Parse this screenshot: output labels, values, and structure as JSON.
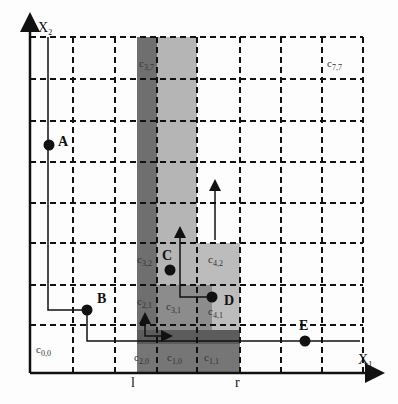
{
  "diagram": {
    "axes": {
      "x_label": "X",
      "x_sub": "1",
      "y_label": "X",
      "y_sub": "2"
    },
    "grid": {
      "cols": 8,
      "rows": 8
    },
    "range_markers": {
      "left": "l",
      "right": "r"
    },
    "points": [
      {
        "id": "A",
        "label": "A"
      },
      {
        "id": "B",
        "label": "B"
      },
      {
        "id": "C",
        "label": "C"
      },
      {
        "id": "D",
        "label": "D"
      },
      {
        "id": "E",
        "label": "E"
      }
    ],
    "cell_labels": {
      "c00": {
        "base": "c",
        "sub": "0,0"
      },
      "c77": {
        "base": "c",
        "sub": "7,7"
      },
      "c37": {
        "base": "c",
        "sub": "3,7"
      },
      "c32": {
        "base": "c",
        "sub": "3,2"
      },
      "c42": {
        "base": "c",
        "sub": "4,2"
      },
      "c31": {
        "base": "c",
        "sub": "3,1"
      },
      "c41": {
        "base": "c",
        "sub": "4,1"
      },
      "c21": {
        "base": "c",
        "sub": "2,1"
      },
      "c20": {
        "base": "c",
        "sub": "2,0"
      },
      "c10": {
        "base": "c",
        "sub": "1,0"
      },
      "c11": {
        "base": "c",
        "sub": "1,1"
      }
    },
    "colors": {
      "dark_shade": "#6e6e6e",
      "mid_shade": "#8a8a8a",
      "light_shade": "#b8b8b8",
      "line": "#111111"
    }
  }
}
